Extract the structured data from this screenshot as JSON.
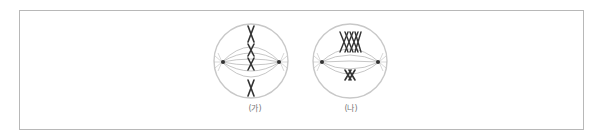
{
  "figure": {
    "panels": [
      {
        "label": "(가)",
        "type": "chromosomes aligned singly at equator (mitosis metaphase)",
        "chromosome_count": 4
      },
      {
        "label": "(나)",
        "type": "homologous chromosome pairs (tetrads) at equator (meiosis I metaphase)",
        "chromosome_count": 2
      }
    ],
    "colors": {
      "border": "#b8b8b8",
      "cell_membrane": "#c8c8c8",
      "spindle": "#9a9a9a",
      "chromosome": "#333333",
      "label": "#777777"
    }
  }
}
